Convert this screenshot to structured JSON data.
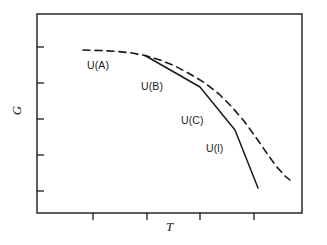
{
  "figure": {
    "background": "#ffffff",
    "ink_color": "#1a1a1a"
  },
  "axes": {
    "y_label": "G",
    "x_label": "T",
    "frame": {
      "left": 37,
      "top": 14,
      "right": 302,
      "bottom": 213
    },
    "y_ticks_px": [
      47,
      83,
      119,
      155,
      191
    ],
    "x_ticks_px": [
      93,
      147,
      200,
      254
    ],
    "tick_labels": [],
    "grid": false
  },
  "curve_labels": {
    "a": "U(A)",
    "b": "U(B)",
    "c": "U(C)",
    "l": "U(l)"
  },
  "chart_data": {
    "type": "line",
    "title": "",
    "subtitle": "",
    "xlabel": "T",
    "ylabel": "G",
    "xlim": [
      37,
      302
    ],
    "ylim": [
      213,
      14
    ],
    "grid": false,
    "legend": "inline-annotations",
    "x_tick_labels": [],
    "y_tick_labels": [],
    "annotations": [
      {
        "text": "U(A)",
        "x": 87,
        "y": 60
      },
      {
        "text": "U(B)",
        "x": 141,
        "y": 81
      },
      {
        "text": "U(C)",
        "x": 181,
        "y": 115
      },
      {
        "text": "U(l)",
        "x": 206,
        "y": 143
      }
    ],
    "series": [
      {
        "name": "metastable-envelope",
        "style": "dashed",
        "color": "#1a1a1a",
        "width": 1.6,
        "dash": "7,5",
        "points": [
          [
            83,
            50
          ],
          [
            100,
            50.5
          ],
          [
            118,
            51.5
          ],
          [
            132,
            53
          ],
          [
            145,
            55.5
          ],
          [
            160,
            60
          ],
          [
            175,
            66
          ],
          [
            190,
            74
          ],
          [
            205,
            83
          ],
          [
            219,
            94
          ],
          [
            232,
            107
          ],
          [
            244,
            121
          ],
          [
            255,
            136
          ],
          [
            266,
            152
          ],
          [
            276,
            166
          ],
          [
            285,
            176
          ],
          [
            290,
            180
          ]
        ]
      },
      {
        "name": "stable-phase-path",
        "style": "solid",
        "color": "#1a1a1a",
        "width": 1.5,
        "points": [
          [
            145,
            55.5
          ],
          [
            200,
            87
          ],
          [
            235,
            130
          ],
          [
            258,
            188
          ]
        ],
        "segments": [
          {
            "label": "U(B)",
            "from": [
              145,
              55.5
            ],
            "to": [
              200,
              87
            ]
          },
          {
            "label": "U(C)",
            "from": [
              200,
              87
            ],
            "to": [
              235,
              130
            ]
          },
          {
            "label": "U(l)",
            "from": [
              235,
              130
            ],
            "to": [
              258,
              188
            ]
          }
        ]
      }
    ]
  }
}
